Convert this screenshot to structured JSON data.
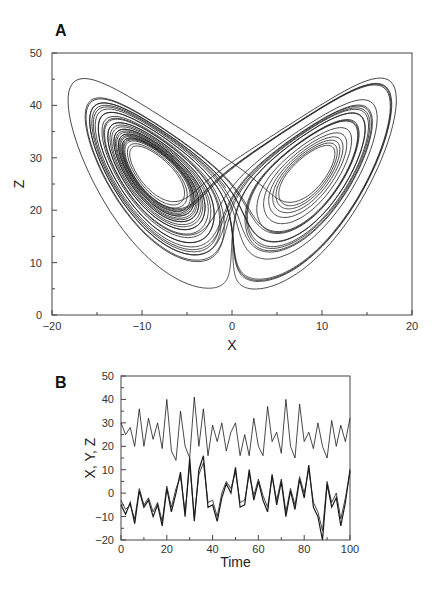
{
  "chart_data": [
    {
      "panel": "A",
      "type": "line",
      "title": "",
      "xlabel": "X",
      "ylabel": "Z",
      "xlim": [
        -20,
        20
      ],
      "ylim": [
        0,
        50
      ],
      "xticks": [
        "-20",
        "-10",
        "0",
        "10",
        "20"
      ],
      "xtick_values": [
        -20,
        -10,
        0,
        10,
        20
      ],
      "yticks": [
        "0",
        "10",
        "20",
        "30",
        "40",
        "50"
      ],
      "ytick_values": [
        0,
        10,
        20,
        30,
        40,
        50
      ],
      "grid": false,
      "description": "Lorenz attractor projection (X vs Z), butterfly shape with two lobes centered near X=-8.5,Z=27 and X=8.5,Z=27",
      "lorenz_params": {
        "sigma": 10,
        "rho": 28,
        "beta": 2.6667,
        "dt": 0.005,
        "steps": 8000,
        "x0": 1,
        "y0": 1,
        "z0": 20
      }
    },
    {
      "panel": "B",
      "type": "line",
      "title": "",
      "xlabel": "Time",
      "ylabel": "X, Y, Z",
      "xlim": [
        0,
        100
      ],
      "ylim": [
        -20,
        50
      ],
      "xticks": [
        "0",
        "20",
        "40",
        "60",
        "80",
        "100"
      ],
      "xtick_values": [
        0,
        20,
        40,
        60,
        80,
        100
      ],
      "yticks": [
        "-20",
        "-10",
        "0",
        "10",
        "20",
        "30",
        "40",
        "50"
      ],
      "ytick_values": [
        -20,
        -10,
        0,
        10,
        20,
        30,
        40,
        50
      ],
      "grid": false,
      "x": [
        0,
        2,
        4,
        6,
        8,
        10,
        12,
        14,
        16,
        18,
        20,
        22,
        24,
        26,
        28,
        30,
        32,
        34,
        36,
        38,
        40,
        42,
        44,
        46,
        48,
        50,
        52,
        54,
        56,
        58,
        60,
        62,
        64,
        66,
        68,
        70,
        72,
        74,
        76,
        78,
        80,
        82,
        84,
        86,
        88,
        90,
        92,
        94,
        96,
        98,
        100
      ],
      "series": [
        {
          "name": "Z",
          "values": [
            30,
            25,
            28,
            20,
            36,
            20,
            32,
            23,
            30,
            19,
            40,
            18,
            14,
            35,
            20,
            15,
            41,
            20,
            36,
            16,
            29,
            22,
            30,
            18,
            26,
            30,
            16,
            25,
            16,
            32,
            20,
            16,
            37,
            22,
            26,
            17,
            40,
            20,
            15,
            38,
            22,
            26,
            19,
            30,
            20,
            15,
            31,
            20,
            29,
            22,
            32
          ]
        },
        {
          "name": "X",
          "values": [
            -5,
            -9,
            -4,
            -13,
            1,
            -6,
            -3,
            -10,
            -5,
            -14,
            2,
            -8,
            0,
            9,
            -10,
            15,
            -12,
            10,
            16,
            -6,
            -5,
            -12,
            -2,
            4,
            0,
            11,
            -6,
            -5,
            10,
            -3,
            5,
            -3,
            -8,
            8,
            -5,
            5,
            -10,
            1,
            -7,
            6,
            -2,
            12,
            -6,
            -10,
            -20,
            4,
            -6,
            -2,
            -14,
            -4,
            10
          ]
        },
        {
          "name": "Y",
          "values": [
            -3,
            -7,
            -5,
            -11,
            2,
            -5,
            -2,
            -8,
            -4,
            -12,
            3,
            -6,
            2,
            7,
            -8,
            12,
            -10,
            8,
            13,
            -4,
            -3,
            -10,
            0,
            5,
            2,
            9,
            -4,
            -3,
            8,
            -1,
            6,
            -1,
            -6,
            7,
            -3,
            6,
            -8,
            2,
            -5,
            7,
            0,
            10,
            -4,
            -8,
            -16,
            5,
            -4,
            0,
            -11,
            -2,
            9
          ]
        }
      ]
    }
  ],
  "panels": {
    "a": {
      "label": "A"
    },
    "b": {
      "label": "B"
    }
  },
  "colors": {
    "line": "#1a1a1a",
    "axis": "#444444",
    "background": "#ffffff"
  }
}
